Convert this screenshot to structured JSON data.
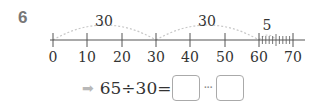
{
  "question": {
    "number": "6"
  },
  "number_line": {
    "ticks": [
      "0",
      "10",
      "20",
      "30",
      "40",
      "50",
      "60",
      "70"
    ],
    "jumps": [
      {
        "from": 0,
        "to": 30,
        "label": "30"
      },
      {
        "from": 30,
        "to": 60,
        "label": "30"
      },
      {
        "from": 60,
        "to": 65,
        "label": "5"
      }
    ],
    "minor_ticks_between": [
      60,
      70
    ],
    "arc_color": "#c8c8c8",
    "line_color": "#555555"
  },
  "equation": {
    "arrow": "➡",
    "expression": "65÷30=",
    "quotient_value": "",
    "separator": "···",
    "remainder_value": ""
  }
}
